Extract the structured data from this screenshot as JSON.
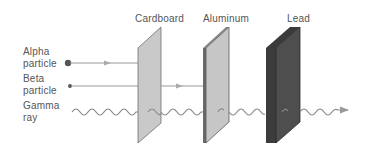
{
  "diagram": {
    "shields": [
      {
        "label": "Cardboard",
        "fill": "#c9c9c9",
        "edge": "#6e6e6e"
      },
      {
        "label": "Aluminum",
        "fill": "#c6c6c6",
        "edge": "#5a5a5a"
      },
      {
        "label": "Lead",
        "fill": "#4a4a4a",
        "edge": "#2a2a2a"
      }
    ],
    "particles": [
      {
        "line1": "Alpha",
        "line2": "particle",
        "stops_at": "Cardboard"
      },
      {
        "line1": "Beta",
        "line2": "particle",
        "stops_at": "Aluminum"
      },
      {
        "line1": "Gamma",
        "line2": "ray",
        "stops_at": "passes through Lead"
      }
    ],
    "colors": {
      "text": "#555555",
      "line": "#9a9a9a",
      "dot": "#555555"
    }
  }
}
